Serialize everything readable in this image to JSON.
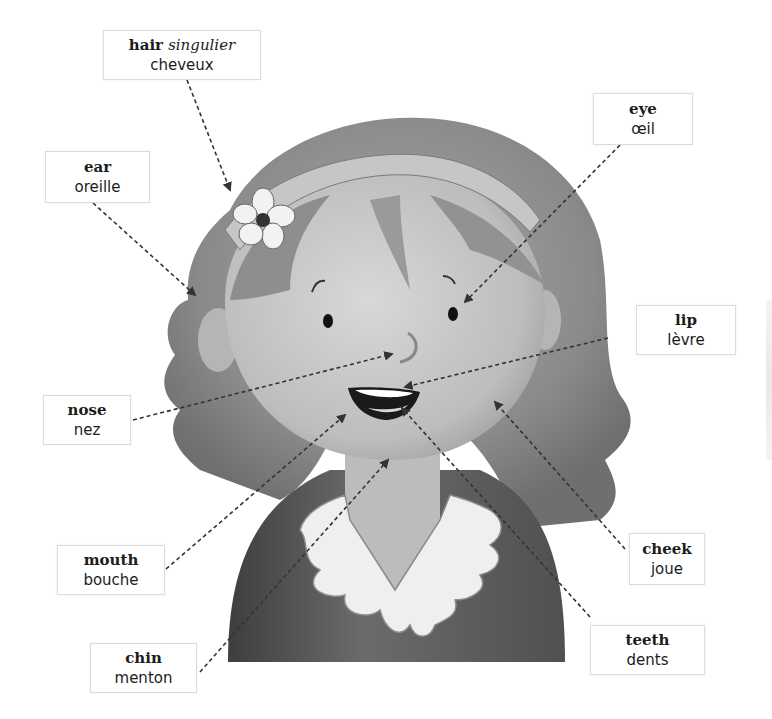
{
  "labels": [
    {
      "id": "hair",
      "english": "hair",
      "note": "singulier",
      "french": "cheveux"
    },
    {
      "id": "ear",
      "english": "ear",
      "note": "",
      "french": "oreille"
    },
    {
      "id": "eye",
      "english": "eye",
      "note": "",
      "french": "œil"
    },
    {
      "id": "lip",
      "english": "lip",
      "note": "",
      "french": "lèvre"
    },
    {
      "id": "nose",
      "english": "nose",
      "note": "",
      "french": "nez"
    },
    {
      "id": "mouth",
      "english": "mouth",
      "note": "",
      "french": "bouche"
    },
    {
      "id": "chin",
      "english": "chin",
      "note": "",
      "french": "menton"
    },
    {
      "id": "cheek",
      "english": "cheek",
      "note": "",
      "french": "joue"
    },
    {
      "id": "teeth",
      "english": "teeth",
      "note": "",
      "french": "dents"
    }
  ],
  "colors": {
    "background": "#ffffff",
    "label_border": "#dcdcdc",
    "text": "#1c1c1c",
    "leader_line": "#333333",
    "hair": "#8c8c8c",
    "skin": "#c8c8c8",
    "shirt": "#5e5e5e",
    "collar": "#f0f0f0"
  }
}
